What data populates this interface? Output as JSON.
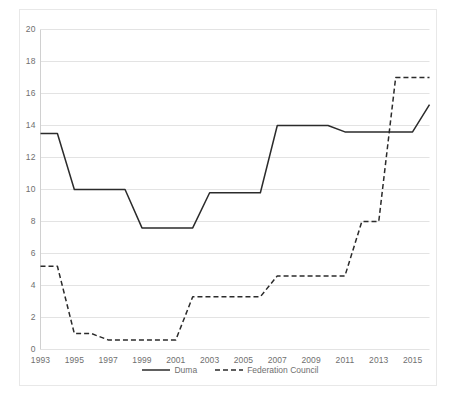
{
  "chart_data": {
    "type": "line",
    "title": "",
    "xlabel": "",
    "ylabel": "",
    "x": [
      1993,
      1994,
      1995,
      1996,
      1997,
      1998,
      1999,
      2000,
      2001,
      2002,
      2003,
      2004,
      2005,
      2006,
      2007,
      2008,
      2009,
      2010,
      2011,
      2012,
      2013,
      2014,
      2015,
      2016
    ],
    "xlim": [
      1993,
      2016
    ],
    "ylim": [
      0,
      20
    ],
    "ytick_step": 2,
    "xtick_step": 2,
    "xticks": [
      "1993",
      "1995",
      "1997",
      "1999",
      "2001",
      "2003",
      "2005",
      "2007",
      "2009",
      "2011",
      "2013",
      "2015"
    ],
    "yticks": [
      "0",
      "2",
      "4",
      "6",
      "8",
      "10",
      "12",
      "14",
      "16",
      "18",
      "20"
    ],
    "grid": "horizontal",
    "legend_position": "bottom",
    "series": [
      {
        "name": "Duma",
        "style": "solid",
        "color": "#2b2b2b",
        "values": [
          13.5,
          13.5,
          10.0,
          10.0,
          10.0,
          10.0,
          7.6,
          7.6,
          7.6,
          7.6,
          9.8,
          9.8,
          9.8,
          9.8,
          14.0,
          14.0,
          14.0,
          14.0,
          13.6,
          13.6,
          13.6,
          13.6,
          13.6,
          15.3
        ]
      },
      {
        "name": "Federation Council",
        "style": "dashed",
        "color": "#2b2b2b",
        "values": [
          5.2,
          5.2,
          1.0,
          1.0,
          0.6,
          0.6,
          0.6,
          0.6,
          0.6,
          3.3,
          3.3,
          3.3,
          3.3,
          3.3,
          4.6,
          4.6,
          4.6,
          4.6,
          4.6,
          8.0,
          8.0,
          17.0,
          17.0,
          17.0
        ]
      }
    ]
  },
  "legend": {
    "items": [
      {
        "label": "Duma",
        "style": "solid"
      },
      {
        "label": "Federation Council",
        "style": "dashed"
      }
    ]
  },
  "colors": {
    "line": "#2b2b2b",
    "grid": "#e3e3e3",
    "frame": "#e8e8e8",
    "text": "#6f6f6f",
    "background": "#ffffff"
  }
}
